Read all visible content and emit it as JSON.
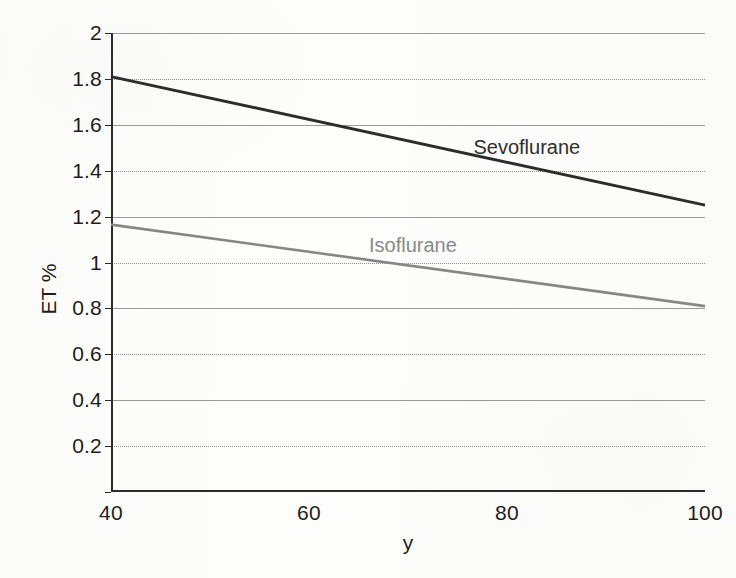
{
  "chart_data": {
    "type": "line",
    "title": "",
    "xlabel": "y",
    "ylabel": "ET %",
    "xlim": [
      40,
      100
    ],
    "ylim": [
      0,
      2
    ],
    "grid": true,
    "legend_position": "inline-annotation",
    "x_ticks": [
      40,
      60,
      80,
      100
    ],
    "x_tick_labels": [
      "40",
      "60",
      "80",
      "100"
    ],
    "y_ticks": [
      0,
      0.2,
      0.4,
      0.6,
      0.8,
      1,
      1.2,
      1.4,
      1.6,
      1.8,
      2
    ],
    "y_tick_labels": [
      "0",
      "0.2",
      "0.4",
      "0.6",
      "0.8",
      "1",
      "1.2",
      "1.4",
      "1.6",
      "1.8",
      "2"
    ],
    "x": [
      40,
      100
    ],
    "series": [
      {
        "name": "Sevoflurane",
        "color": "#2c2c2c",
        "line_width": 3.0,
        "values": [
          1.81,
          1.25
        ],
        "annotation": "Sevoflurane",
        "annotation_x": 82,
        "annotation_y": 1.505
      },
      {
        "name": "Isoflurane",
        "color": "#868686",
        "line_width": 2.6,
        "values": [
          1.165,
          0.81
        ],
        "annotation": "Isoflurane",
        "annotation_x": 70.5,
        "annotation_y": 1.075
      }
    ]
  },
  "figure": {
    "background_color": "#fdfdfb",
    "axis_color": "#2b2b2b",
    "gridline_color": "#8e8e8e",
    "tick_label_color": "#1d1d1d"
  }
}
